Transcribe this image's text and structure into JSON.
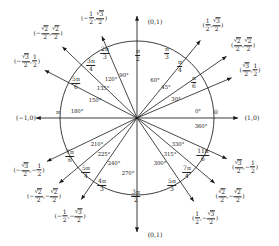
{
  "figure": {
    "center": {
      "x": 137,
      "y": 118
    },
    "radius": 77,
    "stroke_color": "#1b1b1b",
    "background": "#ffffff"
  },
  "axis_endpoint_labels": [
    {
      "name": "right",
      "text": "(1,0)",
      "x": 252,
      "y": 118
    },
    {
      "name": "left",
      "text": "(−1,0)",
      "x": 26,
      "y": 118
    },
    {
      "name": "top",
      "text": "(0,1)",
      "x": 155,
      "y": 22
    },
    {
      "name": "bottom",
      "text": "(0,1)",
      "x": 155,
      "y": 235
    }
  ],
  "axis_inline_labels": [
    {
      "name": "zero-degrees",
      "text": "0°",
      "x": 198,
      "y": 112
    },
    {
      "name": "zero-radians",
      "text": "0",
      "x": 216,
      "y": 112
    },
    {
      "name": "threesixty-degrees",
      "text": "360°",
      "x": 201,
      "y": 127
    },
    {
      "name": "oneeighty-degrees",
      "text": "180°",
      "x": 77,
      "y": 112
    },
    {
      "name": "pi-radians",
      "text": "π",
      "x": 58,
      "y": 112
    },
    {
      "name": "ninety-degrees",
      "text": "90°",
      "x": 124,
      "y": 76
    },
    {
      "name": "twoseventy-degrees",
      "text": "270°",
      "x": 128,
      "y": 174
    }
  ],
  "vertical_radian_labels": [
    {
      "name": "pi-over-2",
      "num": "π",
      "den": "2",
      "x": 138,
      "y": 55
    },
    {
      "name": "three-pi-over-2",
      "num": "3π",
      "den": "2",
      "x": 136,
      "y": 196
    }
  ],
  "spokes": [
    {
      "name": "spoke-30",
      "degrees": "30°",
      "deg_pos": {
        "x": 176,
        "y": 100
      },
      "radian": {
        "num": "π",
        "den": "6"
      },
      "radian_pos": {
        "x": 194,
        "y": 82
      },
      "coordinate": {
        "x_val": {
          "type": "frac_rad",
          "radicand": "3",
          "den": "2",
          "sign": ""
        },
        "y_val": {
          "type": "frac",
          "num": "1",
          "den": "2",
          "sign": ""
        }
      },
      "coord_pos": {
        "x": 250,
        "y": 70
      },
      "angle": 30
    },
    {
      "name": "spoke-45",
      "degrees": "45°",
      "deg_pos": {
        "x": 166,
        "y": 88
      },
      "radian": {
        "num": "π",
        "den": "4"
      },
      "radian_pos": {
        "x": 180,
        "y": 66
      },
      "coordinate": {
        "x_val": {
          "type": "frac_rad",
          "radicand": "2",
          "den": "2",
          "sign": ""
        },
        "y_val": {
          "type": "frac_rad",
          "radicand": "2",
          "den": "2",
          "sign": ""
        }
      },
      "coord_pos": {
        "x": 243,
        "y": 45
      },
      "angle": 45
    },
    {
      "name": "spoke-60",
      "degrees": "60°",
      "deg_pos": {
        "x": 155,
        "y": 81
      },
      "radian": {
        "num": "π",
        "den": "3"
      },
      "radian_pos": {
        "x": 167,
        "y": 53
      },
      "coordinate": {
        "x_val": {
          "type": "frac",
          "num": "1",
          "den": "2",
          "sign": ""
        },
        "y_val": {
          "type": "frac_rad",
          "radicand": "3",
          "den": "2",
          "sign": ""
        }
      },
      "coord_pos": {
        "x": 213,
        "y": 25
      },
      "angle": 60
    },
    {
      "name": "spoke-120",
      "degrees": "120°",
      "deg_pos": {
        "x": 111,
        "y": 80
      },
      "radian": {
        "num": "2π",
        "den": "3"
      },
      "radian_pos": {
        "x": 105,
        "y": 53
      },
      "coordinate": {
        "x_val": {
          "type": "frac",
          "num": "1",
          "den": "2",
          "sign": "−"
        },
        "y_val": {
          "type": "frac_rad",
          "radicand": "3",
          "den": "2",
          "sign": ""
        }
      },
      "coord_pos": {
        "x": 94,
        "y": 18
      },
      "angle": 120
    },
    {
      "name": "spoke-135",
      "degrees": "135°",
      "deg_pos": {
        "x": 103,
        "y": 89
      },
      "radian": {
        "num": "3π",
        "den": "4"
      },
      "radian_pos": {
        "x": 91,
        "y": 65
      },
      "coordinate": {
        "x_val": {
          "type": "frac_rad",
          "radicand": "2",
          "den": "2",
          "sign": "−"
        },
        "y_val": {
          "type": "frac_rad",
          "radicand": "2",
          "den": "2",
          "sign": ""
        }
      },
      "coord_pos": {
        "x": 48,
        "y": 33
      },
      "angle": 135
    },
    {
      "name": "spoke-150",
      "degrees": "150°",
      "deg_pos": {
        "x": 95,
        "y": 101
      },
      "radian": {
        "num": "5π",
        "den": "6"
      },
      "radian_pos": {
        "x": 76,
        "y": 83
      },
      "coordinate": {
        "x_val": {
          "type": "frac_rad",
          "radicand": "3",
          "den": "2",
          "sign": "−"
        },
        "y_val": {
          "type": "frac",
          "num": "1",
          "den": "2",
          "sign": ""
        }
      },
      "coord_pos": {
        "x": 27,
        "y": 61
      },
      "angle": 150
    },
    {
      "name": "spoke-210",
      "degrees": "210°",
      "deg_pos": {
        "x": 97,
        "y": 145
      },
      "radian": {
        "num": "7π",
        "den": "6"
      },
      "radian_pos": {
        "x": 70,
        "y": 156
      },
      "coordinate": {
        "x_val": {
          "type": "frac_rad",
          "radicand": "3",
          "den": "2",
          "sign": "−"
        },
        "y_val": {
          "type": "frac",
          "num": "1",
          "den": "2",
          "sign": "−"
        }
      },
      "coord_pos": {
        "x": 29,
        "y": 170
      },
      "angle": 210
    },
    {
      "name": "spoke-225",
      "degrees": "225°",
      "deg_pos": {
        "x": 104,
        "y": 155
      },
      "radian": {
        "num": "5π",
        "den": "4"
      },
      "radian_pos": {
        "x": 86,
        "y": 172
      },
      "coordinate": {
        "x_val": {
          "type": "frac_rad",
          "radicand": "2",
          "den": "2",
          "sign": "−"
        },
        "y_val": {
          "type": "frac_rad",
          "radicand": "2",
          "den": "2",
          "sign": "−"
        }
      },
      "coord_pos": {
        "x": 44,
        "y": 196
      },
      "angle": 225
    },
    {
      "name": "spoke-240",
      "degrees": "240°",
      "deg_pos": {
        "x": 114,
        "y": 164
      },
      "radian": {
        "num": "4π",
        "den": "3"
      },
      "radian_pos": {
        "x": 102,
        "y": 185
      },
      "coordinate": {
        "x_val": {
          "type": "frac",
          "num": "1",
          "den": "2",
          "sign": "−"
        },
        "y_val": {
          "type": "frac_rad",
          "radicand": "3",
          "den": "2",
          "sign": "−"
        }
      },
      "coord_pos": {
        "x": 70,
        "y": 216
      },
      "angle": 240
    },
    {
      "name": "spoke-300",
      "degrees": "300°",
      "deg_pos": {
        "x": 160,
        "y": 164
      },
      "radian": {
        "num": "5π",
        "den": "3"
      },
      "radian_pos": {
        "x": 172,
        "y": 185
      },
      "coordinate": {
        "x_val": {
          "type": "frac",
          "num": "1",
          "den": "2",
          "sign": ""
        },
        "y_val": {
          "type": "frac_rad",
          "radicand": "3",
          "den": "2",
          "sign": "−"
        }
      },
      "coord_pos": {
        "x": 205,
        "y": 218
      },
      "angle": 300
    },
    {
      "name": "spoke-315",
      "degrees": "315°",
      "deg_pos": {
        "x": 170,
        "y": 155
      },
      "radian": {
        "num": "7π",
        "den": "4"
      },
      "radian_pos": {
        "x": 187,
        "y": 172
      },
      "coordinate": {
        "x_val": {
          "type": "frac_rad",
          "radicand": "2",
          "den": "2",
          "sign": ""
        },
        "y_val": {
          "type": "frac_rad",
          "radicand": "2",
          "den": "2",
          "sign": "−"
        }
      },
      "coord_pos": {
        "x": 230,
        "y": 196
      },
      "angle": 315
    },
    {
      "name": "spoke-330",
      "degrees": "330°",
      "deg_pos": {
        "x": 178,
        "y": 145
      },
      "radian": {
        "num": "11π",
        "den": "6"
      },
      "radian_pos": {
        "x": 203,
        "y": 155
      },
      "coordinate": {
        "x_val": {
          "type": "frac_rad",
          "radicand": "3",
          "den": "2",
          "sign": ""
        },
        "y_val": {
          "type": "frac",
          "num": "1",
          "den": "2",
          "sign": "−"
        }
      },
      "coord_pos": {
        "x": 245,
        "y": 167
      },
      "angle": 330
    }
  ]
}
